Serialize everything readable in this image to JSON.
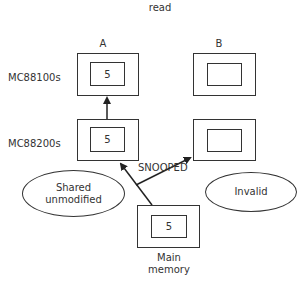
{
  "diagram": {
    "title": "read",
    "columns": [
      {
        "label": "A"
      },
      {
        "label": "B"
      }
    ],
    "rows": [
      {
        "label": "MC88100s"
      },
      {
        "label": "MC88200s"
      }
    ],
    "caches": {
      "a_cpu": {
        "value": "5"
      },
      "b_cpu": {
        "value": ""
      },
      "a_cmmu": {
        "value": "5"
      },
      "b_cmmu": {
        "value": ""
      }
    },
    "main_memory": {
      "value": "5",
      "label_line1": "Main",
      "label_line2": "memory"
    },
    "states": {
      "a_state_line1": "Shared",
      "a_state_line2": "unmodified",
      "b_state": "Invalid"
    },
    "edge_labels": {
      "snooped": "SNOOPED"
    },
    "colors": {
      "stroke": "#333333",
      "background": "#ffffff"
    }
  }
}
